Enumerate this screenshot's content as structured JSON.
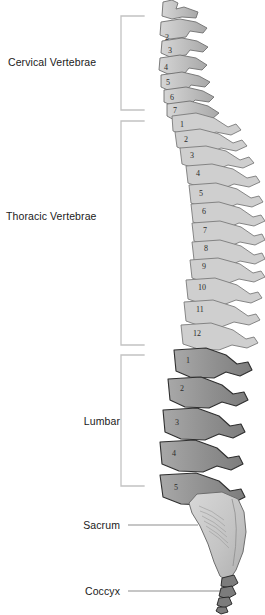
{
  "figure": {
    "background_color": "#ffffff"
  },
  "regions": [
    {
      "id": "cervical",
      "label": "Cervical Vertebrae",
      "connector": "bracket",
      "count": 7,
      "fill_color": "#b9b9b9",
      "stroke_color": "#6e6e6e",
      "bracket": {
        "x": 120,
        "top": 16,
        "bottom": 110,
        "arm": 24
      }
    },
    {
      "id": "thoracic",
      "label": "Thoracic Vertebrae",
      "connector": "bracket",
      "count": 12,
      "fill_color": "#cccccc",
      "stroke_color": "#777777",
      "bracket": {
        "x": 120,
        "top": 121,
        "bottom": 345,
        "arm": 24
      }
    },
    {
      "id": "lumbar",
      "label": "Lumbar",
      "connector": "bracket",
      "count": 5,
      "fill_color": "#9a9a9a",
      "stroke_color": "#2e2e2e",
      "bracket": {
        "x": 120,
        "top": 355,
        "bottom": 486,
        "arm": 24
      }
    },
    {
      "id": "sacrum",
      "label": "Sacrum",
      "connector": "leader-line",
      "count": 1,
      "fill_color": "#c4c4c4",
      "stroke_color": "#6a6a6a",
      "leader": {
        "x1": 128,
        "x2": 196,
        "y": 525
      }
    },
    {
      "id": "coccyx",
      "label": "Coccyx",
      "connector": "leader-line",
      "count": 1,
      "fill_color": "#7a7a7a",
      "stroke_color": "#1e1e1e",
      "leader": {
        "x1": 128,
        "x2": 225,
        "y": 591
      }
    }
  ],
  "vertebra_numbers": {
    "cervical": [
      "2",
      "3",
      "4",
      "5",
      "6",
      "7"
    ],
    "thoracic": [
      "1",
      "2",
      "3",
      "4",
      "5",
      "6",
      "7",
      "8",
      "9",
      "10",
      "11",
      "12"
    ],
    "lumbar": [
      "1",
      "2",
      "3",
      "4",
      "5"
    ]
  },
  "number_positions": {
    "cervical": [
      {
        "n": "2",
        "x": 165,
        "y": 34
      },
      {
        "n": "3",
        "x": 168,
        "y": 47
      },
      {
        "n": "4",
        "x": 164,
        "y": 64
      },
      {
        "n": "5",
        "x": 166,
        "y": 79
      },
      {
        "n": "6",
        "x": 170,
        "y": 94
      },
      {
        "n": "7",
        "x": 173,
        "y": 107
      }
    ],
    "thoracic": [
      {
        "n": "1",
        "x": 180,
        "y": 121
      },
      {
        "n": "2",
        "x": 184,
        "y": 136
      },
      {
        "n": "3",
        "x": 190,
        "y": 152
      },
      {
        "n": "4",
        "x": 196,
        "y": 170
      },
      {
        "n": "5",
        "x": 199,
        "y": 190
      },
      {
        "n": "6",
        "x": 202,
        "y": 208
      },
      {
        "n": "7",
        "x": 203,
        "y": 227
      },
      {
        "n": "8",
        "x": 204,
        "y": 245
      },
      {
        "n": "9",
        "x": 202,
        "y": 263
      },
      {
        "n": "10",
        "x": 198,
        "y": 284
      },
      {
        "n": "11",
        "x": 196,
        "y": 306
      },
      {
        "n": "12",
        "x": 193,
        "y": 330
      }
    ],
    "lumbar": [
      {
        "n": "1",
        "x": 186,
        "y": 357
      },
      {
        "n": "2",
        "x": 180,
        "y": 385
      },
      {
        "n": "3",
        "x": 175,
        "y": 419
      },
      {
        "n": "4",
        "x": 172,
        "y": 450
      },
      {
        "n": "5",
        "x": 174,
        "y": 484
      }
    ]
  }
}
